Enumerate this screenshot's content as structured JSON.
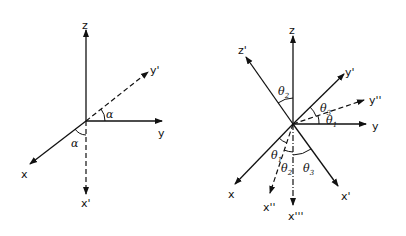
{
  "figure_left": {
    "axes": {
      "z": "z",
      "y": "y",
      "x": "x",
      "y_prime": "y'",
      "x_prime": "x'"
    },
    "angles": {
      "upper": "α",
      "lower": "α"
    }
  },
  "figure_right": {
    "axes": {
      "z": "z",
      "z_prime": "z'",
      "y": "y",
      "y_prime": "y'",
      "y_double_prime": "y''",
      "x": "x",
      "x_prime": "x'",
      "x_double_prime": "x''",
      "x_triple_prime": "x'''"
    },
    "angles": {
      "theta2_upper": "θ",
      "theta2_upper_sub": "2",
      "theta3_upper": "θ",
      "theta3_upper_sub": "3",
      "theta1_upper": "θ",
      "theta1_upper_sub": "1",
      "theta1_lower": "θ",
      "theta1_lower_sub": "1",
      "theta2_lower": "θ",
      "theta2_lower_sub": "2",
      "theta3_lower": "θ",
      "theta3_lower_sub": "3"
    }
  },
  "colors": {
    "ink": "#111111",
    "background": "#ffffff"
  }
}
